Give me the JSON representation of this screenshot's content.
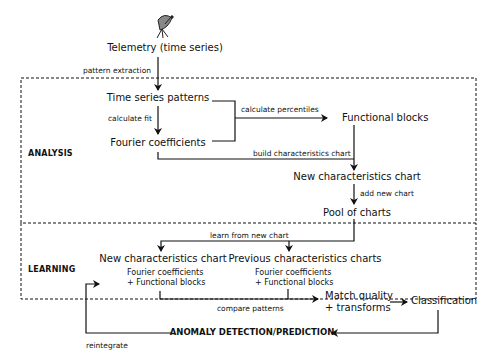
{
  "diagram": {
    "source": {
      "icon": "satellite-dish-icon",
      "label": "Telemetry (time series)"
    },
    "sections": [
      {
        "id": "analysis",
        "label": "ANALYSIS"
      },
      {
        "id": "learning",
        "label": "LEARNING"
      }
    ],
    "nodes": {
      "time_series_patterns": "Time series patterns",
      "fourier_coefficients": "Fourier coefficients",
      "functional_blocks": "Functional blocks",
      "new_characteristics_chart": "New characteristics chart",
      "pool_of_charts": "Pool of charts",
      "learning_new_chart": "New characteristics chart",
      "learning_new_chart_sub1": "Fourier coefficients",
      "learning_new_chart_sub2": "+ Functional blocks",
      "previous_charts": "Previous characteristics charts",
      "previous_charts_sub1": "Fourier coefficients",
      "previous_charts_sub2": "+ Functional blocks",
      "match_quality_1": "Match quality",
      "match_quality_2": "+ transforms",
      "classification": "Classification",
      "anomaly": "ANOMALY DETECTION/PREDICTION"
    },
    "edges": {
      "pattern_extraction": "pattern extraction",
      "calculate_fit": "calculate fit",
      "calculate_percentiles": "calculate percentiles",
      "build_chart": "build characteristics chart",
      "add_new_chart": "add new chart",
      "learn_from_new_chart": "learn from new chart",
      "compare_patterns": "compare patterns",
      "reintegrate": "reintegrate"
    },
    "colors": {
      "line": "#111111",
      "background": "#ffffff"
    }
  }
}
